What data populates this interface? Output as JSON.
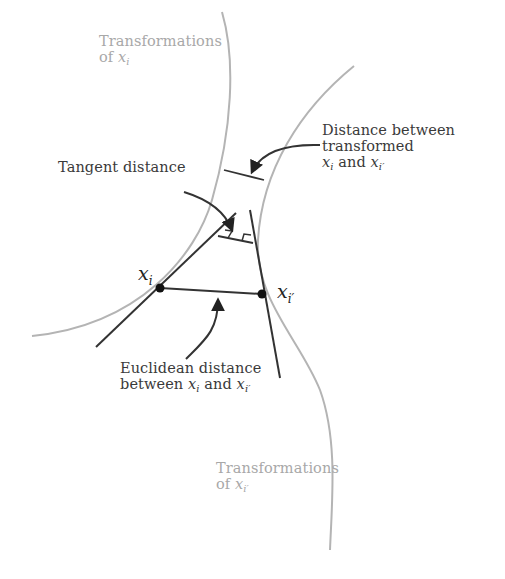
{
  "diagram": {
    "type": "tangent-distance-illustration",
    "colors": {
      "curve": "#b4b4b4",
      "line": "#333333",
      "text": "#3a3a3a",
      "gray_text": "#a8a8a8",
      "point": "#111111"
    },
    "points": {
      "xi": {
        "label": "x",
        "sub": "i",
        "x": 160,
        "y": 288
      },
      "xip": {
        "label": "x",
        "sub": "i′",
        "x": 262,
        "y": 294
      }
    },
    "labels": {
      "transform_xi": {
        "line1": "Transformations",
        "line2_prefix": "of ",
        "line2_math": "x",
        "line2_sub": "i"
      },
      "transform_xip": {
        "line1": "Transformations",
        "line2_prefix": "of ",
        "line2_math": "x",
        "line2_sub": "i′"
      },
      "tangent_distance": {
        "text": "Tangent distance"
      },
      "transformed_distance": {
        "line1": "Distance between",
        "line2": "transformed",
        "line3_a": "x",
        "line3_a_sub": "i",
        "line3_mid": " and ",
        "line3_b": "x",
        "line3_b_sub": "i′"
      },
      "euclidean_distance": {
        "line1": "Euclidean distance",
        "line2_prefix": "between ",
        "line2_a": "x",
        "line2_a_sub": "i",
        "line2_mid": " and ",
        "line2_b": "x",
        "line2_b_sub": "i′"
      }
    }
  }
}
